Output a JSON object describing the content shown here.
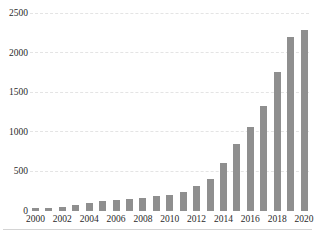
{
  "figure": {
    "background": "#ffffff",
    "text_color": "#2a2a2a",
    "bottom_rule_color": "#c9c9c9",
    "gridline_color": "#e4e4e4"
  },
  "chart_data": {
    "type": "bar",
    "title": "",
    "xlabel": "",
    "ylabel": "",
    "categories": [
      "2000",
      "2001",
      "2002",
      "2003",
      "2004",
      "2005",
      "2006",
      "2007",
      "2008",
      "2009",
      "2010",
      "2011",
      "2012",
      "2013",
      "2014",
      "2015",
      "2016",
      "2017",
      "2018",
      "2019",
      "2020"
    ],
    "values": [
      40,
      35,
      55,
      75,
      95,
      125,
      145,
      150,
      170,
      190,
      205,
      240,
      320,
      400,
      600,
      840,
      1060,
      1320,
      1760,
      2200,
      2290
    ],
    "ylim": [
      0,
      2500
    ],
    "yticks": [
      0,
      500,
      1000,
      1500,
      2000,
      2500
    ],
    "ytick_labels": [
      "0",
      "500",
      "1000",
      "1500",
      "2000",
      "2500"
    ],
    "xtick_labels": [
      "2000",
      "2002",
      "2004",
      "2006",
      "2008",
      "2010",
      "2012",
      "2014",
      "2016",
      "2018",
      "2020"
    ],
    "bar_color": "#8f8f8f",
    "legend": "none",
    "grid": "faint horizontal lines at each y tick"
  }
}
